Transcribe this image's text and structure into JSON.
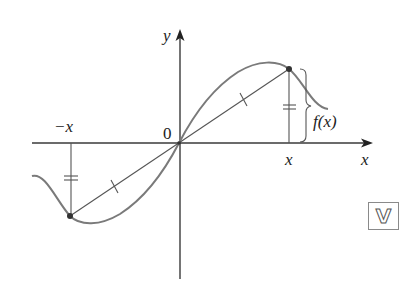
{
  "figure": {
    "labels": {
      "y_axis": "y",
      "x_axis": "x",
      "origin": "0",
      "neg_x": "−x",
      "pos_x": "x",
      "fx": "f(x)"
    },
    "badge": "V",
    "colors": {
      "axis": "#3a3a3a",
      "curve": "#7a7a7a",
      "point": "#333333",
      "text": "#222222"
    },
    "points": {
      "origin": [
        179,
        143
      ],
      "right_point": [
        289,
        69
      ],
      "left_point": [
        70,
        216
      ]
    }
  }
}
